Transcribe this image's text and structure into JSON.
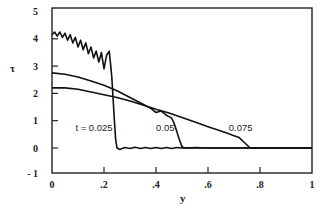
{
  "chart_data": {
    "type": "line",
    "title": "",
    "xlabel": "y",
    "ylabel": "τ",
    "xlim": [
      0,
      1
    ],
    "ylim": [
      -1,
      5
    ],
    "grid": false,
    "legend": "none",
    "x_ticks": [
      {
        "value": 0,
        "label": "0"
      },
      {
        "value": 0.2,
        "label": ".2"
      },
      {
        "value": 0.4,
        "label": ".4"
      },
      {
        "value": 0.6,
        "label": ".6"
      },
      {
        "value": 0.8,
        "label": ".8"
      },
      {
        "value": 1,
        "label": "1"
      }
    ],
    "y_ticks": [
      {
        "value": 5,
        "label": "5"
      },
      {
        "value": 4,
        "label": "4"
      },
      {
        "value": 3,
        "label": "3"
      },
      {
        "value": 2,
        "label": "2"
      },
      {
        "value": 1,
        "label": "1"
      },
      {
        "value": 0,
        "label": "0"
      },
      {
        "value": -1,
        "label": "- 1"
      }
    ],
    "annotations": [
      {
        "text": "t = 0.025",
        "x": 0.09,
        "y": 0.75
      },
      {
        "text": "0.05",
        "x": 0.4,
        "y": 0.75
      },
      {
        "text": "0.075",
        "x": 0.68,
        "y": 0.75
      }
    ],
    "series": [
      {
        "name": "t = 0.025",
        "x": [
          0.0,
          0.01,
          0.02,
          0.03,
          0.04,
          0.05,
          0.06,
          0.07,
          0.08,
          0.09,
          0.1,
          0.11,
          0.12,
          0.13,
          0.14,
          0.15,
          0.16,
          0.17,
          0.18,
          0.19,
          0.2,
          0.21,
          0.22,
          0.225,
          0.23,
          0.235,
          0.24,
          0.245,
          0.25,
          0.26,
          0.28,
          0.3,
          0.32,
          0.34,
          0.36,
          0.38,
          0.4,
          0.42,
          0.44,
          0.46,
          0.48,
          0.5,
          0.52,
          0.54,
          0.56,
          0.58,
          0.6,
          0.62,
          0.64,
          0.66,
          0.68,
          0.7,
          0.72,
          0.74,
          0.76,
          0.78,
          0.8,
          0.85,
          0.9,
          0.95,
          1.0
        ],
        "values": [
          4.15,
          4.25,
          4.1,
          4.25,
          4.05,
          4.2,
          3.95,
          4.15,
          3.85,
          4.05,
          3.7,
          3.95,
          3.6,
          3.85,
          3.45,
          3.7,
          3.3,
          3.55,
          3.15,
          3.5,
          2.9,
          3.4,
          3.55,
          3.1,
          2.6,
          1.8,
          1.0,
          0.3,
          0.0,
          -0.05,
          0.02,
          -0.02,
          0.03,
          -0.02,
          0.02,
          -0.02,
          0.02,
          -0.02,
          0.02,
          -0.02,
          0.02,
          0.0,
          0.0,
          0.0,
          0.0,
          0.0,
          0.0,
          0.0,
          0.0,
          0.0,
          0.0,
          0.0,
          0.0,
          0.0,
          0.0,
          0.0,
          0.0,
          0.0,
          0.0,
          0.0,
          0.0
        ]
      },
      {
        "name": "t = 0.05",
        "x": [
          0.0,
          0.05,
          0.1,
          0.15,
          0.2,
          0.25,
          0.3,
          0.35,
          0.38,
          0.4,
          0.42,
          0.44,
          0.45,
          0.46,
          0.47,
          0.48,
          0.49,
          0.5,
          0.51,
          0.52,
          0.55,
          0.6,
          0.65,
          0.7,
          0.75,
          0.8,
          0.85,
          0.9,
          0.95,
          1.0
        ],
        "values": [
          2.75,
          2.7,
          2.6,
          2.45,
          2.3,
          2.1,
          1.85,
          1.6,
          1.45,
          1.3,
          1.35,
          1.2,
          1.15,
          1.1,
          0.9,
          0.6,
          0.3,
          0.05,
          0.0,
          0.0,
          0.02,
          0.0,
          0.0,
          0.0,
          0.0,
          0.0,
          0.0,
          0.0,
          0.0,
          0.0
        ]
      },
      {
        "name": "t = 0.075",
        "x": [
          0.0,
          0.05,
          0.1,
          0.15,
          0.2,
          0.25,
          0.3,
          0.35,
          0.4,
          0.45,
          0.5,
          0.55,
          0.6,
          0.65,
          0.68,
          0.7,
          0.72,
          0.74,
          0.76,
          0.78,
          0.8,
          0.85,
          0.9,
          0.95,
          1.0
        ],
        "values": [
          2.2,
          2.2,
          2.15,
          2.05,
          1.95,
          1.85,
          1.72,
          1.58,
          1.42,
          1.28,
          1.12,
          0.95,
          0.78,
          0.62,
          0.52,
          0.45,
          0.38,
          0.2,
          0.02,
          0.0,
          0.0,
          0.0,
          0.0,
          0.0,
          0.0
        ]
      }
    ]
  },
  "plot_area": {
    "left": 52,
    "right": 312,
    "top": 8,
    "bottom": 173,
    "y_zero_px": 148,
    "px_per_unit_y": 27.3
  }
}
